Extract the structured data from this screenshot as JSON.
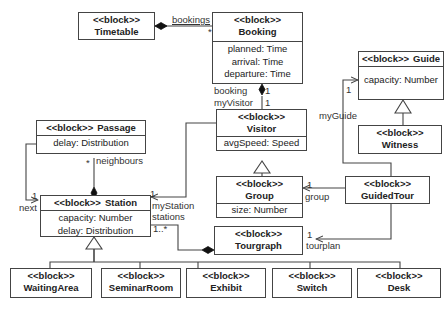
{
  "diagram": {
    "stereotype": "<<block>>",
    "blocks": {
      "timetable": {
        "name": "Timetable",
        "attributes": []
      },
      "booking": {
        "name": "Booking",
        "attributes": [
          "planned: Time",
          "arrival: Time",
          "departure: Time"
        ]
      },
      "guide": {
        "name": "Guide",
        "attributes": [
          "capacity: Number"
        ]
      },
      "witness": {
        "name": "Witness",
        "attributes": []
      },
      "passage": {
        "name": "Passage",
        "attributes": [
          "delay: Distribution"
        ]
      },
      "visitor": {
        "name": "Visitor",
        "attributes": [
          "avgSpeed: Speed"
        ]
      },
      "station": {
        "name": "Station",
        "attributes": [
          "capacity: Number",
          "delay: Distribution"
        ]
      },
      "group": {
        "name": "Group",
        "attributes": [
          "size: Number"
        ]
      },
      "guidedtour": {
        "name": "GuidedTour",
        "attributes": []
      },
      "tourgraph": {
        "name": "Tourgraph",
        "attributes": []
      },
      "waitingarea": {
        "name": "WaitingArea",
        "attributes": []
      },
      "seminarroom": {
        "name": "SeminarRoom",
        "attributes": []
      },
      "exhibit": {
        "name": "Exhibit",
        "attributes": []
      },
      "switch": {
        "name": "Switch",
        "attributes": []
      },
      "desk": {
        "name": "Desk",
        "attributes": []
      }
    },
    "labels": {
      "bookings": "bookings",
      "bookings_mult": "*",
      "booking": "booking",
      "booking_mult": "1",
      "myvisitor": "myVisitor",
      "myvisitor_mult": "1",
      "myguide": "myGuide",
      "myguide_mult": "1",
      "neighbours": "neighbours",
      "neighbours_mult": "*",
      "next": "next",
      "next_mult": "1",
      "mystation": "myStation",
      "mystation_mult": "1",
      "stations": "stations",
      "stations_mult": "1..*",
      "group": "group",
      "group_mult": "1",
      "tourplan": "tourplan",
      "tourplan_mult": "1"
    },
    "relationships": [
      {
        "from": "Timetable",
        "to": "Booking",
        "type": "composition",
        "role": "bookings",
        "multiplicity": "*"
      },
      {
        "from": "Booking",
        "to": "Visitor",
        "type": "composition",
        "roles": [
          "booking",
          "myVisitor"
        ],
        "multiplicity": [
          "1",
          "1"
        ]
      },
      {
        "from": "Witness",
        "to": "Guide",
        "type": "generalization"
      },
      {
        "from": "GuidedTour",
        "to": "Guide",
        "type": "association",
        "role": "myGuide",
        "multiplicity": "1"
      },
      {
        "from": "Station",
        "to": "Passage",
        "type": "composition",
        "role": "neighbours",
        "multiplicity": "*"
      },
      {
        "from": "Passage",
        "to": "Station",
        "type": "association",
        "role": "next",
        "multiplicity": "1"
      },
      {
        "from": "Visitor",
        "to": "Station",
        "type": "association",
        "role": "myStation",
        "multiplicity": "1"
      },
      {
        "from": "Tourgraph",
        "to": "Station",
        "type": "composition",
        "role": "stations",
        "multiplicity": "1..*"
      },
      {
        "from": "Group",
        "to": "Visitor",
        "type": "generalization"
      },
      {
        "from": "GuidedTour",
        "to": "Group",
        "type": "association",
        "role": "group",
        "multiplicity": "1"
      },
      {
        "from": "GuidedTour",
        "to": "Tourgraph",
        "type": "association",
        "role": "tourplan",
        "multiplicity": "1"
      },
      {
        "from": "WaitingArea",
        "to": "Station",
        "type": "generalization"
      },
      {
        "from": "SeminarRoom",
        "to": "Station",
        "type": "generalization"
      },
      {
        "from": "Exhibit",
        "to": "Station",
        "type": "generalization"
      },
      {
        "from": "Switch",
        "to": "Station",
        "type": "generalization"
      },
      {
        "from": "Desk",
        "to": "Station",
        "type": "generalization"
      }
    ],
    "colors": {
      "line": "#444444",
      "text": "#222222",
      "background": "#ffffff"
    }
  }
}
